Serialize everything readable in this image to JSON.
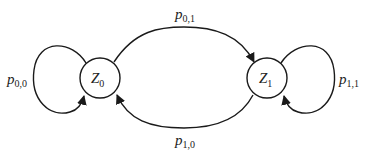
{
  "diagram": {
    "type": "markov-chain-state-diagram",
    "nodes": [
      {
        "id": "Z0",
        "label": "Z",
        "subscript": "0"
      },
      {
        "id": "Z1",
        "label": "Z",
        "subscript": "1"
      }
    ],
    "edges": [
      {
        "from": "Z0",
        "to": "Z0",
        "label": "p",
        "subscript": "0,0"
      },
      {
        "from": "Z0",
        "to": "Z1",
        "label": "p",
        "subscript": "0,1"
      },
      {
        "from": "Z1",
        "to": "Z0",
        "label": "p",
        "subscript": "1,0"
      },
      {
        "from": "Z1",
        "to": "Z1",
        "label": "p",
        "subscript": "1,1"
      }
    ]
  },
  "colors": {
    "stroke": "#1a1a1a",
    "background": "#ffffff"
  }
}
